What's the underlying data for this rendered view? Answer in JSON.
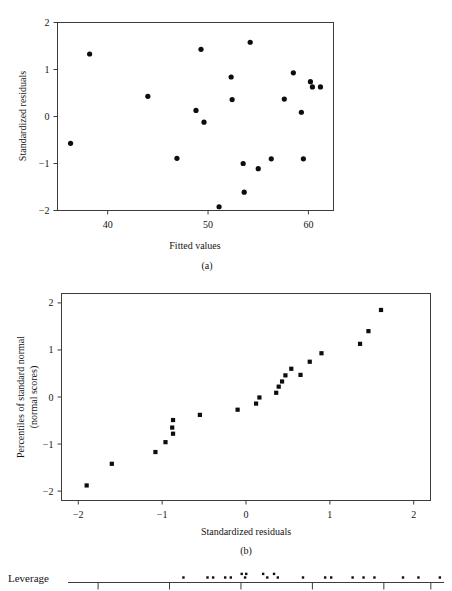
{
  "figure": {
    "panel_a_caption": "(a)",
    "panel_b_caption": "(b)",
    "leverage_label": "Leverage"
  },
  "chart_data": [
    {
      "type": "scatter",
      "name": "residuals-vs-fitted",
      "title": "",
      "xlabel": "Fitted values",
      "ylabel": "Standardized residuals",
      "xlim": [
        35.0,
        62.5
      ],
      "ylim": [
        -2,
        2
      ],
      "xticks": [
        40,
        50,
        60
      ],
      "xticklabels": [
        "40",
        "50",
        "60"
      ],
      "yticks": [
        -2,
        -1,
        0,
        1,
        2
      ],
      "yticklabels": [
        "−2",
        "−1",
        "0",
        "1",
        "2"
      ],
      "grid": false,
      "legend": "none",
      "x": [
        36.3,
        38.2,
        44.0,
        46.9,
        48.8,
        49.3,
        49.6,
        51.1,
        52.3,
        52.4,
        53.5,
        53.6,
        54.2,
        55.0,
        56.3,
        57.6,
        58.5,
        59.3,
        59.5,
        60.2,
        60.4,
        61.2
      ],
      "y": [
        -0.57,
        1.33,
        0.43,
        -0.89,
        0.13,
        1.43,
        -0.12,
        -1.92,
        0.84,
        0.36,
        -1.0,
        -1.61,
        1.58,
        -1.11,
        -0.9,
        0.37,
        0.93,
        0.09,
        -0.9,
        0.74,
        0.63,
        0.63
      ]
    },
    {
      "type": "scatter",
      "name": "normal-probability-plot",
      "title": "",
      "xlabel": "Standardized residuals",
      "ylabel": "Percentiles of standard normal (normal scores)",
      "ylabel_line1": "Percentiles of standard normal",
      "ylabel_line2": "(normal scores)",
      "xlim": [
        -2.2,
        2.2
      ],
      "ylim": [
        -2.2,
        2.2
      ],
      "xticks": [
        -2,
        -1,
        0,
        1,
        2
      ],
      "xticklabels": [
        "−2",
        "−1",
        "0",
        "1",
        "2"
      ],
      "yticks": [
        -2,
        -1,
        0,
        1,
        2
      ],
      "yticklabels": [
        "−2",
        "−1",
        "0",
        "1",
        "2"
      ],
      "grid": false,
      "legend": "none",
      "x": [
        -1.9,
        -1.6,
        -1.08,
        -0.96,
        -0.87,
        -0.88,
        -0.87,
        -0.55,
        -0.1,
        0.12,
        0.16,
        0.36,
        0.39,
        0.43,
        0.47,
        0.54,
        0.65,
        0.76,
        0.9,
        1.36,
        1.46,
        1.61
      ],
      "y": [
        -1.88,
        -1.42,
        -1.17,
        -0.96,
        -0.78,
        -0.65,
        -0.49,
        -0.38,
        -0.27,
        -0.14,
        -0.01,
        0.09,
        0.22,
        0.33,
        0.46,
        0.6,
        0.47,
        0.75,
        0.93,
        1.13,
        1.4,
        1.85
      ]
    },
    {
      "type": "scatter",
      "name": "leverage-strip-plot",
      "title": "",
      "xlabel": "",
      "ylabel": "Leverage",
      "xlim": [
        0.0,
        1.0
      ],
      "ylim": [
        0,
        1
      ],
      "xticks": [
        0.08,
        0.27,
        0.46,
        0.65,
        0.84,
        0.965
      ],
      "xticklabels": [
        "",
        "",
        "",
        "",
        "",
        ""
      ],
      "grid": false,
      "legend": "none",
      "x": [
        0.307,
        0.371,
        0.386,
        0.418,
        0.433,
        0.462,
        0.471,
        0.474,
        0.519,
        0.53,
        0.548,
        0.558,
        0.625,
        0.684,
        0.7,
        0.757,
        0.786,
        0.815,
        0.891,
        0.932,
        0.989
      ],
      "y": [
        0.5,
        0.5,
        0.5,
        0.5,
        0.5,
        0.9,
        0.5,
        0.9,
        0.9,
        0.5,
        0.9,
        0.5,
        0.5,
        0.5,
        0.5,
        0.5,
        0.5,
        0.5,
        0.5,
        0.5,
        0.5
      ]
    }
  ]
}
